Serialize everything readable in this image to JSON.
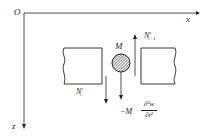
{
  "axes": {
    "origin": "O",
    "x_label": "x",
    "z_label": "z"
  },
  "mass": {
    "label": "M"
  },
  "forces": {
    "left": {
      "symbol": "N",
      "sup": "s",
      "sub": "i"
    },
    "right": {
      "symbol": "N",
      "sup": "s",
      "sub": "i+1"
    },
    "inertia": {
      "prefix": "−M",
      "numerator": "∂²w",
      "denominator": "∂t²"
    }
  },
  "colors": {
    "line": "#222222",
    "background": "#ffffff"
  }
}
